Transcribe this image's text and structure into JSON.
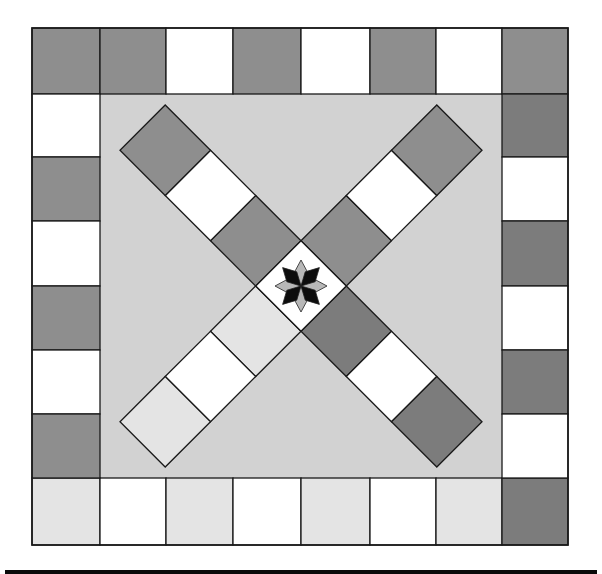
{
  "board": {
    "title": "",
    "colors": {
      "background": "#ffffff",
      "field": "#d2d2d2",
      "dark": "#8e8e8e",
      "darker": "#7c7c7c",
      "light": "#e4e4e4",
      "white": "#ffffff",
      "line": "#1a1a1a",
      "star_dark": "#0d0d0d",
      "star_light": "#b8b8b8"
    },
    "outer_track": {
      "top": [
        "dark",
        "dark",
        "white",
        "dark",
        "white",
        "dark",
        "white",
        "dark"
      ],
      "right": [
        "darker",
        "white",
        "darker",
        "white",
        "darker",
        "white"
      ],
      "bottom": [
        "light",
        "white",
        "light",
        "white",
        "light",
        "white",
        "light",
        "darker"
      ],
      "left": [
        "white",
        "dark",
        "white",
        "dark",
        "white",
        "dark"
      ]
    },
    "arms": {
      "top_left": [
        "dark",
        "white",
        "dark"
      ],
      "top_right": [
        "dark",
        "white",
        "dark"
      ],
      "bottom_right": [
        "darker",
        "white",
        "darker"
      ],
      "bottom_left": [
        "light",
        "white",
        "light"
      ]
    },
    "center": {
      "fill": "white",
      "icon": "eight-point-star-icon"
    }
  }
}
